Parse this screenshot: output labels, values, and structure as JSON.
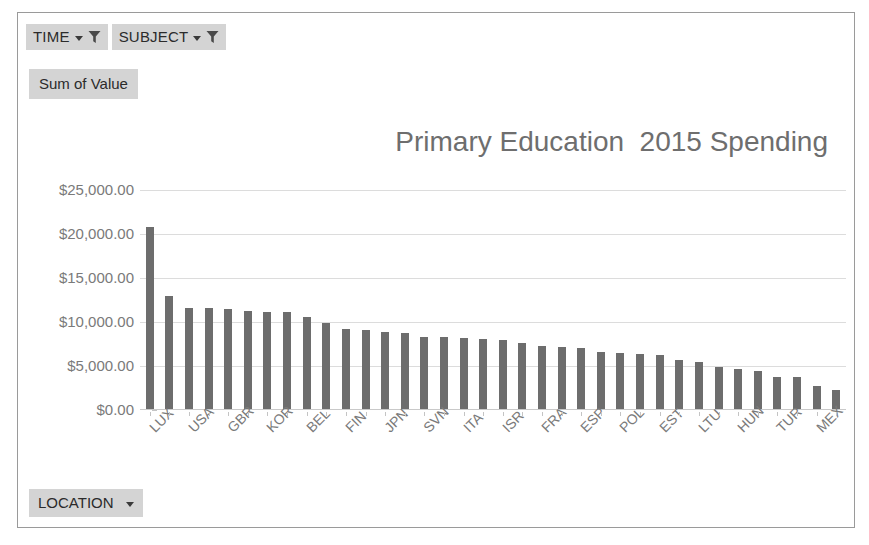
{
  "window": {
    "background": "#ffffff",
    "frame_border_color": "#9a9a9a"
  },
  "slicers": [
    {
      "label": "TIME",
      "icon": "filter-funnel-icon",
      "dropdown": "chevron-down-icon"
    },
    {
      "label": "SUBJECT",
      "icon": "filter-funnel-icon",
      "dropdown": "chevron-down-icon"
    }
  ],
  "value_field": {
    "label": "Sum of Value"
  },
  "axis_field": {
    "label": "LOCATION",
    "dropdown": "chevron-down-icon"
  },
  "colors": {
    "bar": "#6d6d6d",
    "gridline": "#dcdcdc",
    "axis_text": "#7a7a7a",
    "title_text": "#6e6e6e",
    "button_background": "#d4d4d4",
    "button_text": "#2b2b2b"
  },
  "chart_data": {
    "type": "bar",
    "title": "Primary Education  2015 Spending",
    "xlabel": "",
    "ylabel": "",
    "ylim": [
      0,
      25000
    ],
    "ytick_labels": [
      "$25,000.00",
      "$20,000.00",
      "$15,000.00",
      "$10,000.00",
      "$5,000.00",
      "$0.00"
    ],
    "ytick_values": [
      25000,
      20000,
      15000,
      10000,
      5000,
      0
    ],
    "grid": true,
    "legend": false,
    "series_name": "Sum of Value",
    "categories": [
      "LUX",
      "CHE",
      "USA",
      "NOR",
      "GBR",
      "AUT",
      "KOR",
      "SWE",
      "BEL",
      "DNK",
      "FIN",
      "NLD",
      "JPN",
      "DEU",
      "SVN",
      "IRL",
      "ITA",
      "AUS",
      "ISR",
      "NZL",
      "FRA",
      "PRT",
      "ESP",
      "CZE",
      "POL",
      "SVK",
      "EST",
      "LVA",
      "LTU",
      "CHL",
      "HUN",
      "GRC",
      "TUR",
      "COL",
      "MEX",
      "IDN"
    ],
    "visible_tick_labels": [
      "LUX",
      "USA",
      "GBR",
      "KOR",
      "BEL",
      "FIN",
      "JPN",
      "SVN",
      "ITA",
      "ISR",
      "FRA",
      "ESP",
      "POL",
      "EST",
      "LTU",
      "HUN",
      "TUR",
      "MEX"
    ],
    "tick_label_interval": 2,
    "values": [
      20800,
      13000,
      11600,
      11600,
      11500,
      11300,
      11150,
      11100,
      10600,
      9900,
      9250,
      9050,
      8900,
      8800,
      8350,
      8300,
      8200,
      8100,
      8000,
      7600,
      7300,
      7150,
      7000,
      6600,
      6450,
      6350,
      6250,
      5700,
      5400,
      4900,
      4700,
      4450,
      3800,
      3700,
      2700,
      2300
    ]
  }
}
